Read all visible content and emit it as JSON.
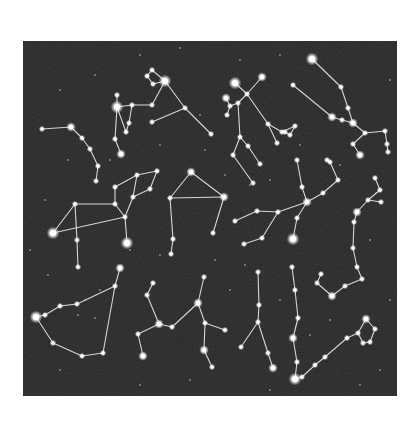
{
  "image": {
    "description": "Star chart illustration of constellations with connecting lines on a dark night sky",
    "background_color": "#ffffff",
    "sky_color": "#262626",
    "line_color": "#e8e8e8",
    "star_color": "#ffffff",
    "sky_rect": {
      "x": 23,
      "y": 41,
      "width": 374,
      "height": 355
    }
  },
  "constellations": [
    {
      "name": "hook-top-left",
      "stars": [
        [
          42,
          129,
          2
        ],
        [
          71,
          127,
          3
        ],
        [
          82,
          138,
          2
        ],
        [
          90,
          149,
          2
        ],
        [
          98,
          166,
          2
        ],
        [
          96,
          181,
          2
        ]
      ],
      "lines": [
        [
          0,
          1
        ],
        [
          1,
          2
        ],
        [
          2,
          3
        ],
        [
          3,
          4
        ],
        [
          4,
          5
        ]
      ]
    },
    {
      "name": "upper-center-left",
      "stars": [
        [
          152,
          70,
          2
        ],
        [
          147,
          76,
          2
        ],
        [
          153,
          84,
          2
        ],
        [
          165,
          81,
          4
        ],
        [
          185,
          108,
          2
        ],
        [
          211,
          134,
          2
        ],
        [
          152,
          122,
          2
        ],
        [
          117,
          95,
          2
        ],
        [
          117,
          107,
          4
        ],
        [
          132,
          105,
          2
        ],
        [
          152,
          105,
          2
        ],
        [
          115,
          139,
          2
        ],
        [
          121,
          154,
          3
        ],
        [
          129,
          123,
          2
        ],
        [
          126,
          132,
          2
        ]
      ],
      "lines": [
        [
          0,
          1
        ],
        [
          1,
          2
        ],
        [
          2,
          3
        ],
        [
          3,
          0
        ],
        [
          3,
          4
        ],
        [
          4,
          5
        ],
        [
          6,
          4
        ],
        [
          7,
          8
        ],
        [
          8,
          9
        ],
        [
          9,
          10
        ],
        [
          10,
          3
        ],
        [
          8,
          11
        ],
        [
          11,
          12
        ],
        [
          9,
          13
        ],
        [
          13,
          14
        ],
        [
          14,
          8
        ]
      ]
    },
    {
      "name": "top-center-right",
      "stars": [
        [
          235,
          83,
          4
        ],
        [
          247,
          94,
          2
        ],
        [
          262,
          77,
          3
        ],
        [
          226,
          98,
          3
        ],
        [
          230,
          106,
          2
        ],
        [
          238,
          103,
          2
        ],
        [
          227,
          115,
          2
        ],
        [
          268,
          124,
          2
        ],
        [
          282,
          132,
          2
        ],
        [
          295,
          126,
          2
        ],
        [
          290,
          135,
          2
        ],
        [
          285,
          132,
          2
        ],
        [
          277,
          143,
          2
        ],
        [
          240,
          137,
          2
        ],
        [
          248,
          146,
          2
        ],
        [
          260,
          164,
          2
        ],
        [
          233,
          155,
          2
        ],
        [
          253,
          183,
          2
        ]
      ],
      "lines": [
        [
          0,
          1
        ],
        [
          1,
          2
        ],
        [
          3,
          4
        ],
        [
          4,
          5
        ],
        [
          5,
          1
        ],
        [
          4,
          6
        ],
        [
          1,
          7
        ],
        [
          7,
          8
        ],
        [
          8,
          9
        ],
        [
          9,
          10
        ],
        [
          10,
          11
        ],
        [
          7,
          12
        ],
        [
          5,
          13
        ],
        [
          13,
          14
        ],
        [
          14,
          15
        ],
        [
          13,
          16
        ],
        [
          16,
          17
        ]
      ]
    },
    {
      "name": "top-right-long",
      "stars": [
        [
          312,
          59,
          4
        ],
        [
          341,
          87,
          2
        ],
        [
          348,
          108,
          2
        ],
        [
          353,
          123,
          3
        ],
        [
          365,
          133,
          2
        ],
        [
          293,
          85,
          2
        ],
        [
          332,
          117,
          3
        ],
        [
          342,
          120,
          2
        ],
        [
          385,
          131,
          2
        ],
        [
          387,
          144,
          2
        ],
        [
          388,
          152,
          2
        ],
        [
          353,
          144,
          2
        ],
        [
          360,
          155,
          3
        ]
      ],
      "lines": [
        [
          0,
          1
        ],
        [
          1,
          2
        ],
        [
          2,
          3
        ],
        [
          3,
          4
        ],
        [
          5,
          6
        ],
        [
          6,
          7
        ],
        [
          7,
          3
        ],
        [
          4,
          8
        ],
        [
          8,
          9
        ],
        [
          9,
          10
        ],
        [
          4,
          11
        ],
        [
          11,
          12
        ]
      ]
    },
    {
      "name": "center-left-animal",
      "stars": [
        [
          53,
          233,
          4
        ],
        [
          75,
          204,
          2
        ],
        [
          115,
          204,
          2
        ],
        [
          125,
          217,
          2
        ],
        [
          133,
          197,
          2
        ],
        [
          137,
          175,
          2
        ],
        [
          157,
          171,
          2
        ],
        [
          150,
          189,
          2
        ],
        [
          127,
          243,
          4
        ],
        [
          77,
          240,
          2
        ],
        [
          78,
          267,
          2
        ],
        [
          115,
          187,
          2
        ]
      ],
      "lines": [
        [
          0,
          1
        ],
        [
          1,
          2
        ],
        [
          2,
          3
        ],
        [
          3,
          4
        ],
        [
          4,
          5
        ],
        [
          5,
          6
        ],
        [
          6,
          7
        ],
        [
          7,
          4
        ],
        [
          3,
          8
        ],
        [
          0,
          3
        ],
        [
          1,
          9
        ],
        [
          9,
          10
        ],
        [
          2,
          11
        ],
        [
          11,
          5
        ]
      ]
    },
    {
      "name": "center-house",
      "stars": [
        [
          191,
          172,
          3
        ],
        [
          170,
          198,
          2
        ],
        [
          224,
          197,
          3
        ],
        [
          213,
          233,
          2
        ],
        [
          173,
          239,
          2
        ],
        [
          171,
          254,
          2
        ]
      ],
      "lines": [
        [
          0,
          1
        ],
        [
          0,
          2
        ],
        [
          1,
          2
        ],
        [
          2,
          3
        ],
        [
          1,
          4
        ],
        [
          4,
          5
        ]
      ]
    },
    {
      "name": "center-right-branch",
      "stars": [
        [
          235,
          221,
          2
        ],
        [
          257,
          211,
          2
        ],
        [
          278,
          212,
          2
        ],
        [
          307,
          202,
          3
        ],
        [
          323,
          193,
          2
        ],
        [
          338,
          180,
          2
        ],
        [
          330,
          162,
          2
        ],
        [
          327,
          160,
          2
        ],
        [
          302,
          187,
          2
        ],
        [
          297,
          160,
          2
        ],
        [
          262,
          238,
          2
        ],
        [
          244,
          244,
          2
        ],
        [
          297,
          218,
          2
        ],
        [
          293,
          239,
          4
        ]
      ],
      "lines": [
        [
          0,
          1
        ],
        [
          1,
          2
        ],
        [
          2,
          3
        ],
        [
          3,
          4
        ],
        [
          4,
          5
        ],
        [
          5,
          6
        ],
        [
          6,
          7
        ],
        [
          3,
          8
        ],
        [
          8,
          9
        ],
        [
          2,
          10
        ],
        [
          10,
          11
        ],
        [
          3,
          12
        ],
        [
          12,
          13
        ]
      ]
    },
    {
      "name": "right-edge-vertical",
      "stars": [
        [
          375,
          178,
          2
        ],
        [
          380,
          190,
          2
        ],
        [
          368,
          200,
          2
        ],
        [
          357,
          212,
          3
        ],
        [
          354,
          222,
          2
        ],
        [
          353,
          248,
          2
        ],
        [
          357,
          267,
          2
        ],
        [
          362,
          279,
          2
        ],
        [
          381,
          202,
          2
        ],
        [
          345,
          286,
          2
        ],
        [
          332,
          296,
          3
        ],
        [
          317,
          283,
          2
        ],
        [
          321,
          274,
          2
        ]
      ],
      "lines": [
        [
          0,
          1
        ],
        [
          1,
          2
        ],
        [
          2,
          3
        ],
        [
          3,
          4
        ],
        [
          4,
          5
        ],
        [
          5,
          6
        ],
        [
          6,
          7
        ],
        [
          2,
          8
        ],
        [
          7,
          9
        ],
        [
          9,
          10
        ],
        [
          10,
          11
        ],
        [
          11,
          12
        ]
      ]
    },
    {
      "name": "bottom-left-triangle",
      "stars": [
        [
          120,
          268,
          3
        ],
        [
          115,
          286,
          2
        ],
        [
          103,
          353,
          2
        ],
        [
          82,
          356,
          2
        ],
        [
          53,
          343,
          2
        ],
        [
          36,
          317,
          4
        ],
        [
          45,
          315,
          2
        ],
        [
          60,
          306,
          2
        ],
        [
          77,
          304,
          2
        ]
      ],
      "lines": [
        [
          0,
          1
        ],
        [
          1,
          2
        ],
        [
          2,
          3
        ],
        [
          3,
          4
        ],
        [
          4,
          5
        ],
        [
          5,
          6
        ],
        [
          6,
          7
        ],
        [
          7,
          8
        ],
        [
          8,
          1
        ]
      ]
    },
    {
      "name": "bottom-center-bird",
      "stars": [
        [
          153,
          283,
          2
        ],
        [
          147,
          295,
          2
        ],
        [
          159,
          324,
          3
        ],
        [
          172,
          327,
          2
        ],
        [
          198,
          303,
          3
        ],
        [
          204,
          277,
          2
        ],
        [
          138,
          334,
          2
        ],
        [
          143,
          356,
          3
        ],
        [
          205,
          323,
          2
        ],
        [
          225,
          330,
          2
        ],
        [
          204,
          350,
          3
        ],
        [
          212,
          367,
          2
        ]
      ],
      "lines": [
        [
          0,
          1
        ],
        [
          1,
          2
        ],
        [
          2,
          3
        ],
        [
          3,
          4
        ],
        [
          4,
          5
        ],
        [
          2,
          6
        ],
        [
          6,
          7
        ],
        [
          4,
          8
        ],
        [
          8,
          9
        ],
        [
          8,
          10
        ],
        [
          10,
          11
        ]
      ]
    },
    {
      "name": "bottom-center-stick",
      "stars": [
        [
          258,
          272,
          2
        ],
        [
          259,
          305,
          2
        ],
        [
          258,
          322,
          2
        ],
        [
          241,
          347,
          2
        ],
        [
          268,
          353,
          2
        ],
        [
          273,
          368,
          3
        ]
      ],
      "lines": [
        [
          0,
          1
        ],
        [
          1,
          2
        ],
        [
          2,
          3
        ],
        [
          2,
          4
        ],
        [
          4,
          5
        ]
      ]
    },
    {
      "name": "bottom-right-long",
      "stars": [
        [
          292,
          267,
          2
        ],
        [
          295,
          290,
          2
        ],
        [
          298,
          318,
          2
        ],
        [
          293,
          338,
          3
        ],
        [
          297,
          362,
          2
        ],
        [
          295,
          379,
          4
        ],
        [
          302,
          377,
          2
        ],
        [
          315,
          365,
          2
        ],
        [
          325,
          357,
          2
        ],
        [
          347,
          338,
          2
        ],
        [
          358,
          333,
          2
        ],
        [
          366,
          319,
          3
        ],
        [
          375,
          329,
          2
        ],
        [
          370,
          342,
          2
        ],
        [
          363,
          343,
          2
        ]
      ],
      "lines": [
        [
          0,
          1
        ],
        [
          1,
          2
        ],
        [
          2,
          3
        ],
        [
          3,
          4
        ],
        [
          4,
          5
        ],
        [
          5,
          6
        ],
        [
          6,
          7
        ],
        [
          7,
          8
        ],
        [
          8,
          9
        ],
        [
          9,
          10
        ],
        [
          10,
          11
        ],
        [
          11,
          12
        ],
        [
          12,
          13
        ],
        [
          13,
          14
        ],
        [
          14,
          10
        ]
      ]
    }
  ],
  "faint_stars": [
    [
      60,
      90
    ],
    [
      95,
      75
    ],
    [
      140,
      55
    ],
    [
      180,
      48
    ],
    [
      200,
      115
    ],
    [
      45,
      200
    ],
    [
      68,
      160
    ],
    [
      110,
      160
    ],
    [
      160,
      145
    ],
    [
      205,
      150
    ],
    [
      225,
      175
    ],
    [
      250,
      185
    ],
    [
      270,
      180
    ],
    [
      300,
      145
    ],
    [
      340,
      165
    ],
    [
      370,
      240
    ],
    [
      390,
      300
    ],
    [
      330,
      320
    ],
    [
      310,
      335
    ],
    [
      280,
      300
    ],
    [
      230,
      290
    ],
    [
      190,
      380
    ],
    [
      140,
      385
    ],
    [
      100,
      290
    ],
    [
      85,
      300
    ],
    [
      78,
      315
    ],
    [
      95,
      318
    ],
    [
      48,
      275
    ],
    [
      380,
      370
    ],
    [
      360,
      385
    ],
    [
      270,
      390
    ],
    [
      245,
      265
    ],
    [
      215,
      260
    ],
    [
      160,
      255
    ],
    [
      390,
      80
    ],
    [
      280,
      55
    ],
    [
      240,
      60
    ],
    [
      130,
      250
    ],
    [
      60,
      370
    ],
    [
      30,
      250
    ]
  ]
}
